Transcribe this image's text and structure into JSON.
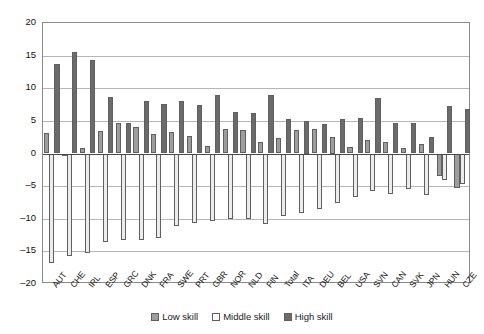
{
  "chart_data": {
    "type": "bar",
    "title": "",
    "subtitle": "",
    "xlabel": "",
    "ylabel": "",
    "ylim": [
      -20,
      20
    ],
    "yticks": [
      20,
      15,
      10,
      5,
      0,
      -5,
      -10,
      -15,
      -20
    ],
    "ytick_labels": [
      "20",
      "15",
      "10",
      "5",
      "0",
      "-5",
      "-10",
      "-15",
      "-20"
    ],
    "grid": true,
    "legend_position": "bottom-center",
    "categories": [
      "AUT",
      "CHE",
      "IRL",
      "ESP",
      "GRC",
      "DNK",
      "FRA",
      "SWE",
      "PRT",
      "GBR",
      "NOR",
      "NLD",
      "FIN",
      "Total",
      "ITA",
      "DEU",
      "BEL",
      "USA",
      "SVN",
      "CAN",
      "SVK",
      "JPN",
      "HUN",
      "CZE"
    ],
    "series": [
      {
        "name": "Low skill",
        "color": "#9d9d9d",
        "values": [
          3.1,
          -0.2,
          0.8,
          3.4,
          4.6,
          4.0,
          3.0,
          3.3,
          2.7,
          1.2,
          3.8,
          3.6,
          1.8,
          2.4,
          3.6,
          3.8,
          2.5,
          1.0,
          2.0,
          1.7,
          0.8,
          1.4,
          -3.5,
          -5.3
        ]
      },
      {
        "name": "Middle skill",
        "color": "#ececec",
        "values": [
          -16.8,
          -15.7,
          -15.2,
          -13.6,
          -13.3,
          -13.2,
          -12.9,
          -11.1,
          -10.6,
          -10.3,
          -10.0,
          -10.0,
          -10.8,
          -9.6,
          -9.1,
          -8.5,
          -7.6,
          -6.6,
          -5.8,
          -6.2,
          -5.5,
          -6.4,
          -4.0,
          -4.6
        ]
      },
      {
        "name": "High skill",
        "color": "#6b6b6b",
        "values": [
          13.7,
          15.6,
          14.4,
          8.7,
          4.7,
          8.0,
          7.6,
          8.0,
          7.4,
          8.9,
          6.3,
          6.2,
          8.9,
          5.3,
          5.0,
          4.5,
          5.3,
          5.4,
          8.5,
          4.6,
          4.7,
          2.6,
          7.3,
          6.8
        ]
      }
    ]
  },
  "legend": {
    "items": [
      {
        "label": "Low skill",
        "key": "low"
      },
      {
        "label": "Middle skill",
        "key": "middle"
      },
      {
        "label": "High skill",
        "key": "high"
      }
    ]
  }
}
